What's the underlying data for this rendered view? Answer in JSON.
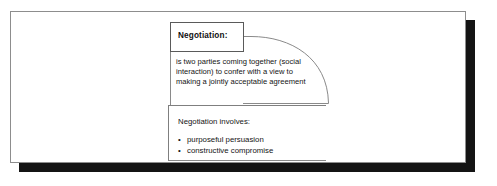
{
  "figure": {
    "title_box": {
      "label": "Negotiation:"
    },
    "definition": {
      "lines": [
        "is two parties coming together (social",
        "interaction) to confer with a view to",
        "making a jointly acceptable agreement"
      ]
    },
    "involves_box": {
      "heading": "Negotiation involves:",
      "bullet_marker": "•",
      "items": [
        "purposeful persuasion",
        "constructive compromise"
      ]
    },
    "colors": {
      "page_background": "#ffffff",
      "frame_border": "#8d8d8d",
      "box_border": "#5a5a5a",
      "connector_line": "#8a8a8a",
      "text": "#141414",
      "drop_shadow": "#141414"
    }
  }
}
